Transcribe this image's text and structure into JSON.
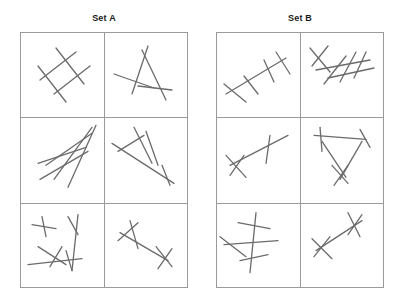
{
  "page": {
    "background_color": "#ffffff",
    "width": 402,
    "height": 305
  },
  "style": {
    "grid_border_color": "#9a9a9a",
    "stroke_color": "#6b6b6b",
    "stroke_width": 1.3,
    "title_color": "#1a1a1a"
  },
  "sets": [
    {
      "id": "set-a",
      "title": "Set A",
      "grid": {
        "x": 20,
        "y": 32,
        "width": 168,
        "height": 256,
        "cols": 2,
        "rows": 3,
        "cell_width": 84,
        "cell_height": 85.3
      },
      "cells": [
        {
          "id": "a1",
          "position": "row1-col1",
          "description": "parallelogram of four crossing strokes",
          "strokes": [
            [
              20,
              48,
              56,
              20
            ],
            [
              34,
              62,
              70,
              34
            ],
            [
              18,
              34,
              46,
              70
            ],
            [
              36,
              16,
              64,
              52
            ]
          ]
        },
        {
          "id": "a2",
          "position": "row1-col2",
          "description": "triangular A shape with crossing strokes",
          "strokes": [
            [
              44,
              14,
              28,
              62
            ],
            [
              38,
              18,
              62,
              68
            ],
            [
              10,
              42,
              50,
              56
            ],
            [
              34,
              54,
              68,
              58
            ]
          ]
        },
        {
          "id": "a3",
          "position": "row2-col1",
          "description": "lattice of four long strokes forming a ladder",
          "strokes": [
            [
              26,
              48,
              72,
              16
            ],
            [
              20,
              62,
              68,
              34
            ],
            [
              34,
              62,
              72,
              10
            ],
            [
              48,
              70,
              76,
              8
            ],
            [
              18,
              46,
              66,
              30
            ]
          ]
        },
        {
          "id": "a4",
          "position": "row2-col2",
          "description": "long diagonal crossed by several strokes",
          "strokes": [
            [
              8,
              26,
              70,
              66
            ],
            [
              14,
              34,
              40,
              18
            ],
            [
              30,
              10,
              48,
              46
            ],
            [
              42,
              14,
              54,
              48
            ],
            [
              58,
              48,
              66,
              68
            ]
          ]
        },
        {
          "id": "a5",
          "position": "row3-col1",
          "description": "two small crosses plus a low cluster",
          "strokes": [
            [
              12,
              22,
              36,
              26
            ],
            [
              22,
              14,
              26,
              34
            ],
            [
              48,
              14,
              58,
              32
            ],
            [
              58,
              12,
              52,
              68
            ],
            [
              8,
              62,
              62,
              56
            ],
            [
              18,
              44,
              46,
              62
            ],
            [
              42,
              44,
              30,
              64
            ],
            [
              46,
              48,
              52,
              68
            ]
          ]
        },
        {
          "id": "a6",
          "position": "row3-col2",
          "description": "diagonal stroke crossed at both ends",
          "strokes": [
            [
              16,
              30,
              64,
              58
            ],
            [
              14,
              38,
              34,
              20
            ],
            [
              26,
              18,
              34,
              46
            ],
            [
              52,
              44,
              68,
              64
            ],
            [
              68,
              46,
              54,
              66
            ]
          ]
        }
      ]
    },
    {
      "id": "set-b",
      "title": "Set B",
      "grid": {
        "x": 216,
        "y": 32,
        "width": 168,
        "height": 256,
        "cols": 2,
        "rows": 3,
        "cell_width": 84,
        "cell_height": 85.3
      },
      "cells": [
        {
          "id": "b1",
          "position": "row1-col1",
          "description": "diagonal spine crossed by three short strokes",
          "strokes": [
            [
              10,
              62,
              70,
              26
            ],
            [
              8,
              52,
              30,
              70
            ],
            [
              28,
              44,
              42,
              62
            ],
            [
              48,
              28,
              58,
              50
            ],
            [
              60,
              20,
              74,
              42
            ]
          ]
        },
        {
          "id": "b2",
          "position": "row1-col2",
          "description": "diagonal spine with cross at top-left and three ticks",
          "strokes": [
            [
              10,
              16,
              30,
              40
            ],
            [
              28,
              14,
              12,
              34
            ],
            [
              16,
              38,
              70,
              28
            ],
            [
              24,
              52,
              46,
              24
            ],
            [
              40,
              50,
              56,
              20
            ],
            [
              54,
              46,
              66,
              20
            ],
            [
              28,
              46,
              74,
              36
            ]
          ]
        },
        {
          "id": "b3",
          "position": "row2-col1",
          "description": "single long shallow diagonal with two crossings",
          "strokes": [
            [
              14,
              48,
              72,
              18
            ],
            [
              10,
              38,
              30,
              60
            ],
            [
              28,
              38,
              14,
              58
            ],
            [
              54,
              18,
              50,
              46
            ]
          ]
        },
        {
          "id": "b4",
          "position": "row2-col2",
          "description": "open triangle with crossings at vertices",
          "strokes": [
            [
              14,
              18,
              66,
              22
            ],
            [
              20,
              10,
              22,
              34
            ],
            [
              60,
              12,
              70,
              30
            ],
            [
              22,
              24,
              46,
              60
            ],
            [
              62,
              24,
              40,
              62
            ],
            [
              32,
              48,
              48,
              66
            ],
            [
              48,
              48,
              34,
              68
            ]
          ]
        },
        {
          "id": "b5",
          "position": "row3-col1",
          "description": "vertical spine with three horizontal crossbars",
          "strokes": [
            [
              40,
              10,
              34,
              70
            ],
            [
              22,
              20,
              54,
              26
            ],
            [
              8,
              42,
              62,
              38
            ],
            [
              24,
              58,
              52,
              52
            ],
            [
              4,
              34,
              30,
              54
            ]
          ]
        },
        {
          "id": "b6",
          "position": "row3-col2",
          "description": "short diagonal crossed at both ends",
          "strokes": [
            [
              16,
              48,
              62,
              18
            ],
            [
              12,
              36,
              32,
              56
            ],
            [
              30,
              34,
              14,
              54
            ],
            [
              48,
              10,
              60,
              34
            ],
            [
              62,
              12,
              48,
              32
            ]
          ]
        }
      ]
    }
  ]
}
